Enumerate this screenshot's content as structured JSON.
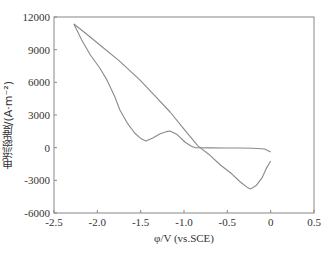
{
  "chart_data": {
    "type": "line",
    "title": "",
    "xlabel": "φ/V (vs.SCE)",
    "ylabel": "电流密度/(A·m⁻²)",
    "xlim": [
      -2.5,
      0.5
    ],
    "ylim": [
      -6000,
      12000
    ],
    "xticks": [
      -2.5,
      -2.0,
      -1.5,
      -1.0,
      -0.5,
      0,
      0.5
    ],
    "xtick_labels": [
      "-2.5",
      "-2.0",
      "-1.5",
      "-1.0",
      "-0.5",
      "0",
      "0.5"
    ],
    "yticks": [
      -6000,
      -3000,
      0,
      3000,
      6000,
      9000,
      12000
    ],
    "ytick_labels": [
      "-6000",
      "-3000",
      "0",
      "3000",
      "6000",
      "9000",
      "12000"
    ],
    "grid": false,
    "legend": null,
    "line_color": "#8a8a8a",
    "series": [
      {
        "name": "branch-a",
        "x": [
          -2.27,
          -2.15,
          -1.97,
          -1.75,
          -1.51,
          -1.34,
          -1.16,
          -1.0,
          -0.84,
          -0.7,
          -0.58,
          -0.45,
          -0.35,
          -0.27,
          -0.23,
          -0.17,
          -0.1,
          -0.05,
          0.0
        ],
        "y": [
          11360,
          10600,
          9430,
          8000,
          6220,
          4800,
          3280,
          1700,
          160,
          -700,
          -1590,
          -2400,
          -3150,
          -3650,
          -3790,
          -3500,
          -2780,
          -1900,
          -1220
        ]
      },
      {
        "name": "branch-b",
        "x": [
          -2.27,
          -2.18,
          -2.08,
          -1.97,
          -1.89,
          -1.8,
          -1.74,
          -1.65,
          -1.57,
          -1.5,
          -1.44,
          -1.36,
          -1.28,
          -1.2,
          -1.16,
          -1.08,
          -0.99,
          -0.92,
          -0.87,
          -0.7,
          -0.5,
          -0.35,
          -0.2,
          -0.07,
          0.0
        ],
        "y": [
          11360,
          9900,
          8510,
          7300,
          6220,
          4700,
          3460,
          2200,
          1350,
          850,
          620,
          900,
          1260,
          1480,
          1530,
          1200,
          520,
          150,
          0,
          -20,
          -30,
          -30,
          -60,
          -120,
          -400
        ]
      }
    ]
  }
}
